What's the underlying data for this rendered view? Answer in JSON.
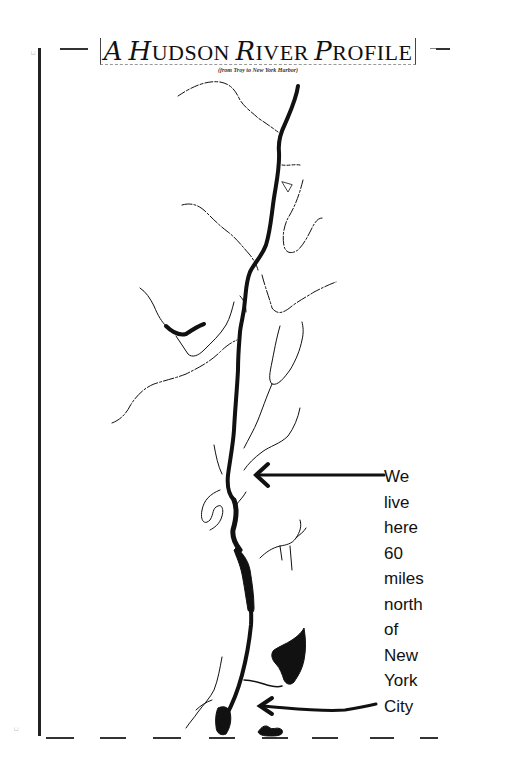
{
  "map": {
    "title": {
      "first_cap": "A",
      "word2_cap": "H",
      "word2_rest": "UDSON",
      "word3_cap": "R",
      "word3_rest": "IVER",
      "word4_cap": "P",
      "word4_rest": "ROFILE",
      "full_text": "A Hudson River Profile"
    },
    "subtitle": "(from Troy to New York Harbor)",
    "annotation": {
      "lines": [
        "We",
        "live",
        "here",
        "60",
        "miles",
        "north",
        "of",
        "New",
        "York",
        "City"
      ],
      "full_text": "We live here 60 miles north of New York City"
    },
    "arrows": [
      {
        "name": "we-live-here-arrow",
        "points_to": "mid-Hudson valley location"
      },
      {
        "name": "new-york-city-arrow",
        "points_to": "New York Harbor"
      }
    ],
    "features": {
      "main_river": "Hudson River",
      "colors": {
        "ink": "#111111",
        "paper": "#ffffff",
        "frame": "#222222"
      }
    }
  }
}
